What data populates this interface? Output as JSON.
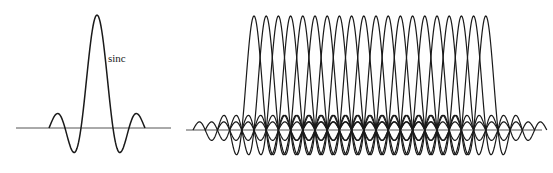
{
  "figure": {
    "left_panel": {
      "label": "sinc",
      "label_pos": [
        108,
        62
      ],
      "baseline": {
        "x1": 16,
        "x2": 171,
        "y": 128
      },
      "center_x": 97,
      "zero_spacing_px": 16,
      "amplitude_px": 113,
      "lobe_range_zeros": 3
    },
    "right_panel": {
      "baseline": {
        "x1": 186,
        "x2": 542,
        "y": 130
      },
      "subcarrier_count": 20,
      "first_center_x": 254,
      "spacing_px": 12.2,
      "zero_spacing_px": 12.2,
      "amplitude_px": 114,
      "lobe_range_zeros": 5
    },
    "colors": {
      "curve": "#1a1a1a",
      "baseline": "#555555",
      "background": "#ffffff"
    }
  }
}
